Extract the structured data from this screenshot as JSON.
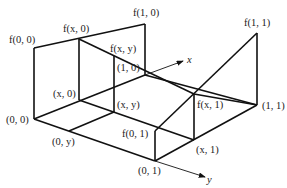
{
  "diagram": {
    "title": "",
    "type": "bilinear interpolation 3D schematic",
    "points": {
      "p00": {
        "label": "(0, 0)",
        "x": 34,
        "y": 119
      },
      "p10": {
        "label": "(1, 0)",
        "x": 145,
        "y": 75
      },
      "p01": {
        "label": "(0, 1)",
        "x": 155,
        "y": 161
      },
      "p11": {
        "label": "(1, 1)",
        "x": 257,
        "y": 105
      },
      "px0": {
        "label": "(x, 0)",
        "x": 79,
        "y": 100
      },
      "pxy": {
        "label": "(x, y)",
        "x": 114,
        "y": 112
      },
      "p0y": {
        "label": "(0, y)",
        "x": 69,
        "y": 131
      },
      "px1": {
        "label": "(x, 1)",
        "x": 194,
        "y": 140
      }
    },
    "values": {
      "f00": {
        "label": "f(0, 0)",
        "x": 34,
        "y": 48
      },
      "f10": {
        "label": "f(1, 0)",
        "x": 145,
        "y": 24
      },
      "f01": {
        "label": "f(0, 1)",
        "x": 155,
        "y": 131
      },
      "f11": {
        "label": "f(1, 1)",
        "x": 257,
        "y": 33
      },
      "fx0": {
        "label": "f(x, 0)",
        "x": 79,
        "y": 39
      },
      "fxy": {
        "label": "f(x, y)",
        "x": 114,
        "y": 57
      },
      "fx1": {
        "label": "f(x, 1)",
        "x": 194,
        "y": 94
      }
    },
    "axes": {
      "x_label": "x",
      "y_label": "y"
    }
  }
}
